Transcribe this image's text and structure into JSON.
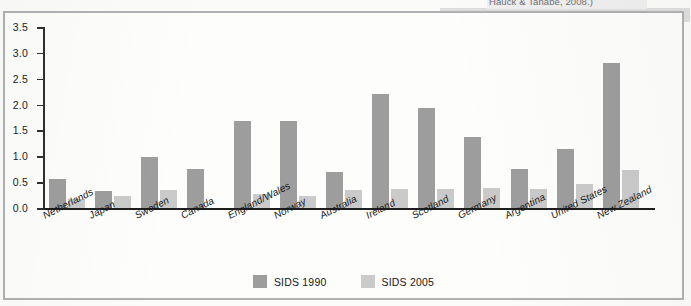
{
  "caption_fragment": "Hauck & Tanabe, 2008.)",
  "legend": [
    {
      "label": "SIDS 1990",
      "color": "#9d9d9d"
    },
    {
      "label": "SIDS 2005",
      "color": "#cacaca"
    }
  ],
  "chart_data": {
    "type": "bar",
    "title": "",
    "xlabel": "",
    "ylabel": "",
    "ylim": [
      0,
      3.5
    ],
    "yticks": [
      "0.0",
      "0.5",
      "1.0",
      "1.5",
      "2.0",
      "2.5",
      "3.0",
      "3.5"
    ],
    "ytick_values": [
      0.0,
      0.5,
      1.0,
      1.5,
      2.0,
      2.5,
      3.0,
      3.5
    ],
    "grid": false,
    "legend_position": "bottom",
    "categories": [
      "Netherlands",
      "Japan",
      "Sweden",
      "Canada",
      "England/Wales",
      "Norway",
      "Australia",
      "Ireland",
      "Scotland",
      "Germany",
      "Argentina",
      "United States",
      "New Zealand"
    ],
    "series": [
      {
        "name": "SIDS 1990",
        "color": "#9d9d9d",
        "values": [
          0.57,
          0.32,
          0.99,
          0.75,
          1.69,
          1.68,
          0.7,
          2.21,
          1.93,
          1.38,
          0.75,
          1.14,
          2.8
        ]
      },
      {
        "name": "SIDS 2005",
        "color": "#cacaca",
        "values": [
          0.17,
          0.23,
          0.34,
          0.0,
          0.28,
          0.24,
          0.34,
          0.36,
          0.37,
          0.39,
          0.36,
          0.47,
          0.73
        ]
      }
    ]
  }
}
